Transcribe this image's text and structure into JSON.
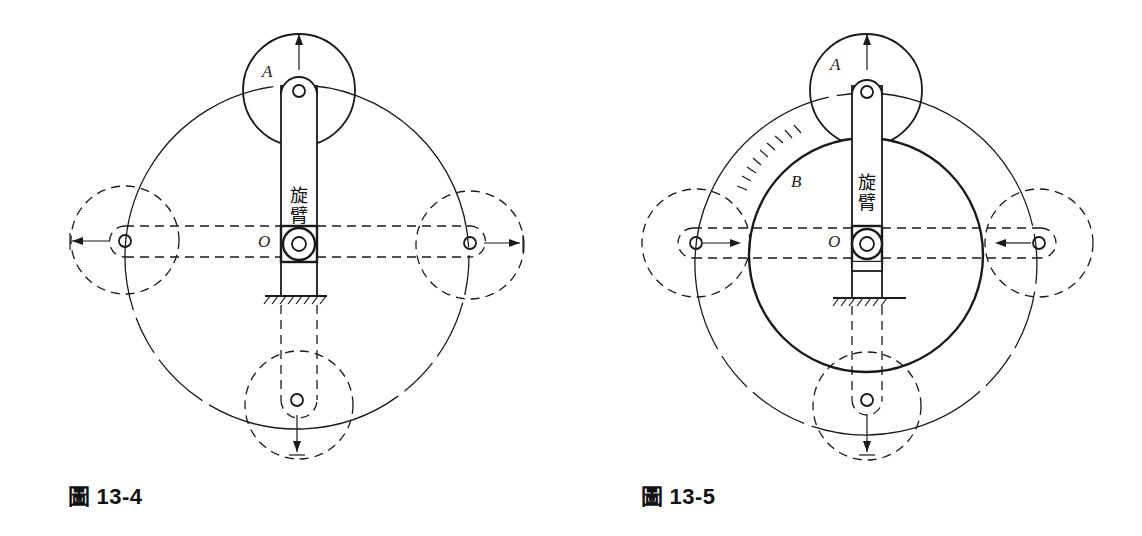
{
  "figures": [
    {
      "caption_prefix": "圖",
      "caption_number": "13-4",
      "labels": {
        "gear": "A",
        "center": "O",
        "arm_line1": "旋",
        "arm_line2": "臂"
      }
    },
    {
      "caption_prefix": "圖",
      "caption_number": "13-5",
      "labels": {
        "gear": "A",
        "sun": "B",
        "center": "O",
        "arm_line1": "旋",
        "arm_line2": "臂"
      }
    }
  ],
  "colors": {
    "line": "#1a1a1a",
    "background": "#ffffff"
  }
}
